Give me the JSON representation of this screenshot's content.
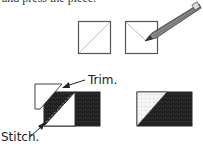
{
  "header": {
    "clipped_text": "and press the piece."
  },
  "step1": {
    "squares": [
      {
        "name": "square-diagonal-drawn",
        "x": 78,
        "y": 21,
        "size": 32
      },
      {
        "name": "square-being-marked",
        "x": 125,
        "y": 21,
        "size": 32
      }
    ],
    "tool": "pencil"
  },
  "step2": {
    "labels": {
      "trim": "Trim.",
      "stitch": "Stitch."
    },
    "colors": {
      "dark_fabric": "#1f1f1f",
      "light_fabric": "#eeeeee",
      "outline": "#444444",
      "stitch_line": "#9a9a9a"
    }
  }
}
